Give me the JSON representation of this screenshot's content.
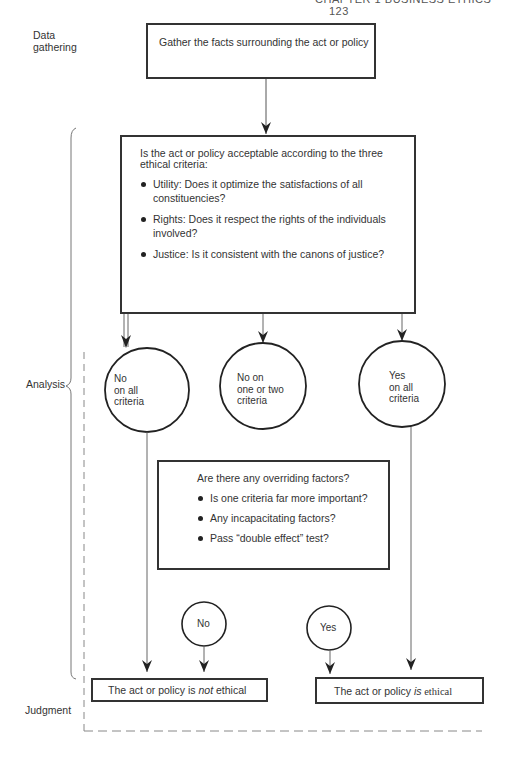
{
  "page_header": {
    "text": "CHAPTER 1  BUSINESS ETHICS",
    "page_number": "123"
  },
  "stages": {
    "data_gathering": "Data\ngathering",
    "analysis": "Analysis",
    "judgment": "Judgment"
  },
  "nodes": {
    "gather": {
      "text": "Gather the facts surrounding the act or policy"
    },
    "criteria": {
      "question": "Is the act or policy acceptable according to the three ethical criteria:",
      "items": [
        "Utility: Does it optimize the satisfactions of all constituencies?",
        "Rights: Does it respect the rights of the individuals involved?",
        "Justice: Is it consistent with the canons of justice?"
      ]
    },
    "outcome_no_all": {
      "line1": "No",
      "line2": "on all",
      "line3": "criteria"
    },
    "outcome_no_some": {
      "line1": "No on",
      "line2": "one or two",
      "line3": "criteria"
    },
    "outcome_yes_all": {
      "line1": "Yes",
      "line2": "on all",
      "line3": "criteria"
    },
    "overriding": {
      "question": "Are there any overriding factors?",
      "items": [
        "Is one criteria far more important?",
        "Any incapacitating factors?",
        "Pass “double effect” test?"
      ]
    },
    "decision_no": {
      "text": "No"
    },
    "decision_yes": {
      "text": "Yes"
    },
    "judgment_not_ethical": {
      "prefix": "The act or policy is ",
      "emphasis": "not",
      "suffix": " ethical"
    },
    "judgment_ethical": {
      "prefix": "The act or policy ",
      "emphasis": "is",
      "suffix": " ethical"
    }
  },
  "colors": {
    "line": "#333333",
    "dashed": "#888888",
    "text": "#333333"
  }
}
